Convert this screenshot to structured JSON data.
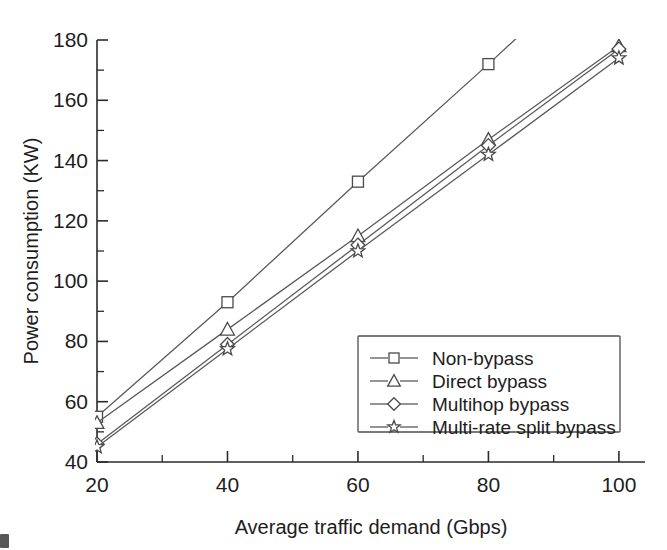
{
  "chart_data": {
    "type": "line",
    "title": "",
    "xlabel": "Average traffic demand (Gbps)",
    "ylabel": "Power consumption (KW)",
    "x": [
      20,
      40,
      60,
      80,
      100
    ],
    "xticks": [
      "20",
      "40",
      "60",
      "80",
      "100"
    ],
    "yticks": [
      "40",
      "60",
      "80",
      "100",
      "120",
      "140",
      "160",
      "180"
    ],
    "xlim": [
      20,
      104
    ],
    "ylim": [
      40,
      180
    ],
    "grid": false,
    "minor_ticks": true,
    "legend_position": "lower-right-inside",
    "series": [
      {
        "name": "Non-bypass",
        "marker": "square",
        "values": [
          55,
          93,
          133,
          172,
          212
        ]
      },
      {
        "name": "Direct bypass",
        "marker": "triangle",
        "values": [
          53,
          84,
          115,
          147,
          178
        ]
      },
      {
        "name": "Multihop bypass",
        "marker": "diamond",
        "values": [
          46,
          79,
          112,
          145,
          177
        ]
      },
      {
        "name": "Multi-rate split bypass",
        "marker": "star",
        "values": [
          45,
          77.5,
          110,
          142,
          174
        ]
      }
    ]
  },
  "axes": {
    "x_title": "Average traffic demand (Gbps)",
    "y_title": "Power consumption (KW)",
    "x_tick_labels": [
      "20",
      "40",
      "60",
      "80",
      "100"
    ],
    "y_tick_labels": [
      "40",
      "60",
      "80",
      "100",
      "120",
      "140",
      "160",
      "180"
    ]
  },
  "legend": {
    "entries": [
      {
        "label": "Non-bypass",
        "marker": "square"
      },
      {
        "label": "Direct bypass",
        "marker": "triangle"
      },
      {
        "label": "Multihop bypass",
        "marker": "diamond"
      },
      {
        "label": "Multi-rate split bypass",
        "marker": "star"
      }
    ]
  },
  "colors": {
    "line": "#5a5a5a",
    "axis": "#2b2b2b",
    "text": "#1d1d1d",
    "background": "#ffffff"
  }
}
